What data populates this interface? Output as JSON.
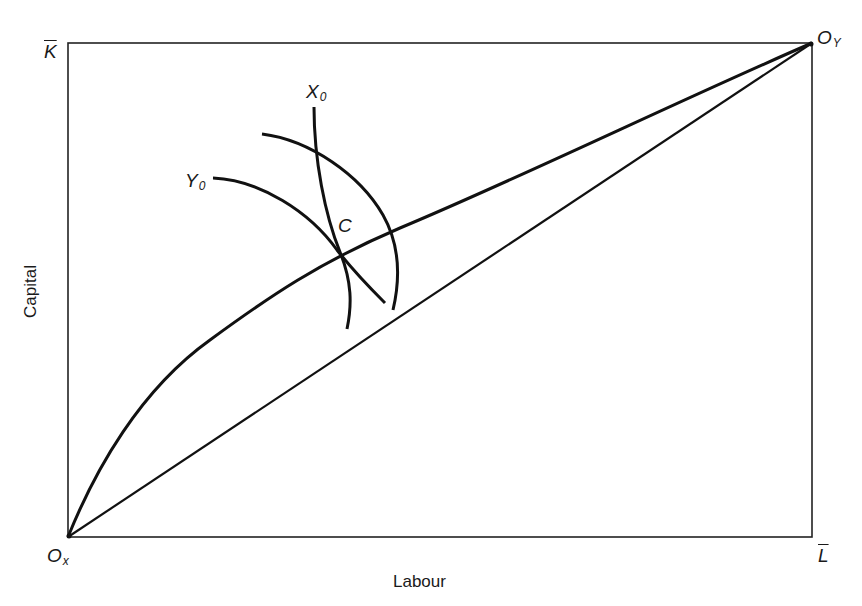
{
  "diagram": {
    "type": "edgeworth-box",
    "axis_labels": {
      "x": "Labour",
      "y": "Capital"
    },
    "corner_labels": {
      "top_left": {
        "main": "K",
        "overline": true
      },
      "bottom_right": {
        "main": "L",
        "overline": true
      },
      "origin_x": {
        "main": "O",
        "sub": "x"
      },
      "origin_y": {
        "main": "O",
        "sub": "Y"
      }
    },
    "curve_labels": {
      "x0": {
        "main": "X",
        "sub": "0"
      },
      "y0": {
        "main": "Y",
        "sub": "0"
      },
      "point_c": "C"
    },
    "elements": [
      {
        "name": "box",
        "description": "Edgeworth box frame"
      },
      {
        "name": "contract-curve",
        "description": "Curved efficiency locus from Ox to Oy passing through C"
      },
      {
        "name": "diagonal",
        "description": "Straight line from Ox to Oy"
      },
      {
        "name": "isoquant-x0",
        "description": "Isoquant X0 for good X"
      },
      {
        "name": "isoquant-y0",
        "description": "Isoquant Y0 for good Y"
      },
      {
        "name": "isoquant-x-upper",
        "description": "Second isoquant arc"
      }
    ],
    "colors": {
      "stroke": "#111111",
      "background": "#ffffff"
    }
  }
}
